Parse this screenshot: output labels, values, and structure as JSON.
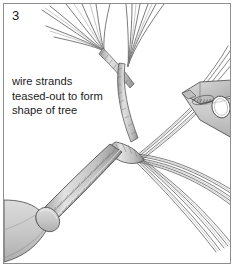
{
  "figure": {
    "step_number": "3",
    "caption_lines": [
      "wire strands",
      "teased-out to form",
      "shape of tree"
    ],
    "border_color": "#8e8e8e",
    "background_color": "#ffffff",
    "text_color": "#1c1c1c",
    "metal_fill": "#c9c9c9",
    "metal_fill_light": "#d8d8d8",
    "metal_fill_dark": "#b0b0b0",
    "wire_stroke": "#4a4a4a",
    "wire_stroke_light": "#8a8a8a",
    "outline_stroke": "#545454",
    "elements": {
      "pliers_label": "pliers-tool",
      "clamp_label": "base-clamp",
      "trunk_label": "twisted-wire-trunk",
      "junction_label": "branch-junction",
      "upper_left_branch_label": "upper-left-branch",
      "upper_center_branch_label": "upper-center-branch",
      "right_branch_label": "right-branch-to-pliers",
      "lower_right_branch_a_label": "lower-right-branch-upper",
      "lower_right_branch_b_label": "lower-right-branch-lower"
    }
  }
}
